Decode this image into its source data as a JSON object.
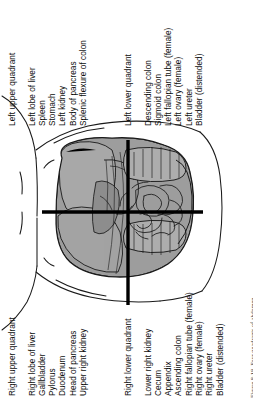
{
  "figure": {
    "caption": "Figure 8-18.  Four quadrants of abdomen.",
    "orientation": "rotated-90-ccw",
    "colors": {
      "ink": "#111111",
      "organ_fill": "#9a9a9a",
      "organ_fill_light": "#b9b9b9",
      "outline": "#1a1a1a",
      "divider": "#000000",
      "background": "#ffffff"
    }
  },
  "quadrants": [
    {
      "id": "left-upper-quadrant",
      "title": "Left upper quadrant",
      "organs": [
        "Left lobe of liver",
        "Spleen",
        "Stomach",
        "Left kidney",
        "Body of pancreas",
        "Splenic flexure of colon"
      ]
    },
    {
      "id": "left-lower-quadrant",
      "title": "Left lower quadrant",
      "organs": [
        "Descending colon",
        "Sigmoid colon",
        "Left fallopian tube (female)",
        "Left ovary (female)",
        "Left ureter",
        "Bladder (distended)"
      ]
    },
    {
      "id": "right-upper-quadrant",
      "title": "Right upper quadrant",
      "organs": [
        "Right lobe of liver",
        "Gallbladder",
        "Pylorus",
        "Duodenum",
        "Head of pancreas",
        "Upper right kidney"
      ]
    },
    {
      "id": "right-lower-quadrant",
      "title": "Right lower quadrant",
      "organs": [
        "Lower right kidney",
        "Cecum",
        "Appendix",
        "Ascending colon",
        "Right fallopian tube (female)",
        "Right ovary (female)",
        "Right ureter",
        "Bladder (distended)"
      ]
    }
  ],
  "illustration": {
    "name": "abdomen-quadrants-illustration",
    "description": "Anterior view of torso with abdominal viscera, divided by vertical and horizontal midlines into four quadrants",
    "divider_vertical": "vertical-midline",
    "divider_horizontal": "horizontal-midline"
  }
}
